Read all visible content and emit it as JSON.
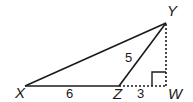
{
  "diagram": {
    "type": "geometry-triangle",
    "points": {
      "X": {
        "label": "X",
        "x": 25,
        "y": 86
      },
      "Z": {
        "label": "Z",
        "x": 119,
        "y": 86
      },
      "W": {
        "label": "W",
        "x": 166,
        "y": 86
      },
      "Y": {
        "label": "Y",
        "x": 166,
        "y": 23
      }
    },
    "segments": [
      {
        "from": "X",
        "to": "Y",
        "style": "solid"
      },
      {
        "from": "X",
        "to": "Z",
        "style": "solid",
        "length_label": "6"
      },
      {
        "from": "Z",
        "to": "Y",
        "style": "solid",
        "length_label": "5"
      },
      {
        "from": "Z",
        "to": "W",
        "style": "dotted",
        "length_label": "3"
      },
      {
        "from": "W",
        "to": "Y",
        "style": "dotted"
      }
    ],
    "right_angle_at": "W",
    "labels": {
      "X": "X",
      "Y": "Y",
      "Z": "Z",
      "W": "W",
      "xz": "6",
      "zy": "5",
      "zw": "3"
    },
    "colors": {
      "line": "#1a1a1a",
      "background": "#ffffff"
    }
  }
}
